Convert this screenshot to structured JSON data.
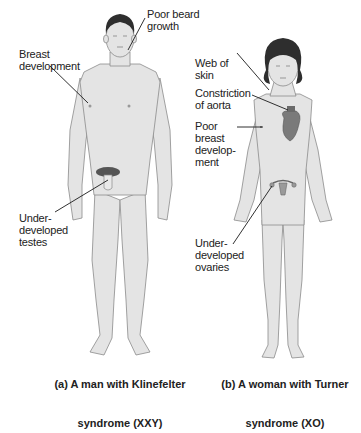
{
  "figure": {
    "panel_a": {
      "caption_line1": "(a) A man with Klinefelter",
      "caption_line2": "syndrome (XXY)",
      "labels": {
        "poor_beard": "Poor beard\ngrowth",
        "breast": "Breast\ndevelopment",
        "testes": "Under-\ndeveloped\ntestes"
      }
    },
    "panel_b": {
      "caption_line1": "(b) A woman with Turner",
      "caption_line2": "syndrome (XO)",
      "labels": {
        "web": "Web of\nskin",
        "aorta": "Constriction\nof aorta",
        "poor_breast": "Poor\nbreast\ndevelop-\nment",
        "ovaries": "Under-\ndeveloped\novaries"
      }
    },
    "colors": {
      "skin": "#e4e4e4",
      "outline": "#8a8a8a",
      "hair": "#2e2e2e",
      "heart": "#7a7a7a",
      "leader": "#1a1a1a"
    }
  }
}
